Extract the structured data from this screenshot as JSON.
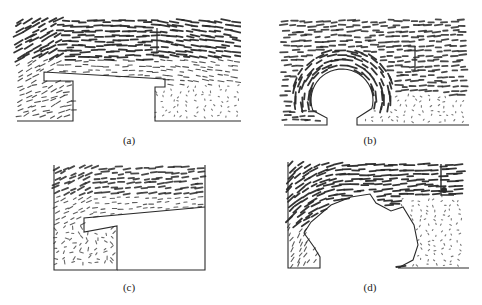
{
  "figure": {
    "panels": [
      {
        "id": "a",
        "caption": "(a)",
        "obstacle": "rectangular-step-with-overhang"
      },
      {
        "id": "b",
        "caption": "(b)",
        "obstacle": "semicircular-arch"
      },
      {
        "id": "c",
        "caption": "(c)",
        "obstacle": "overhang-step-walled"
      },
      {
        "id": "d",
        "caption": "(d)",
        "obstacle": "irregular-arch"
      }
    ],
    "colors": {
      "ink": "#2a2a2a",
      "background": "#ffffff"
    }
  }
}
